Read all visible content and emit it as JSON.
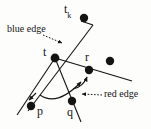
{
  "figure": {
    "name": "edge-flip-geometry-diagram",
    "background_color": "#fdfdfb",
    "ink_color": "#141414",
    "labels": {
      "tk_base": "t",
      "tk_sub": "k",
      "t": "t",
      "r": "r",
      "p": "p",
      "q": "q",
      "blue_edge": "blue edge",
      "red_edge": "red edge"
    },
    "points": [
      {
        "id": "t",
        "label": "t",
        "x": 55,
        "y": 58,
        "radius": 4.2
      },
      {
        "id": "tk",
        "label": "t",
        "x": 84,
        "y": 18,
        "radius": 4.2
      },
      {
        "id": "r",
        "label": "r",
        "x": 89,
        "y": 70,
        "radius": 4.2
      },
      {
        "id": "p",
        "label": "p",
        "x": 31,
        "y": 106,
        "radius": 4.2
      },
      {
        "id": "q",
        "label": "q",
        "x": 72,
        "y": 101,
        "radius": 4.2
      },
      {
        "id": "s",
        "label": "",
        "x": 110,
        "y": 61,
        "radius": 4.2
      }
    ],
    "segments": [
      {
        "id": "blue-edge-line",
        "x1": 93,
        "y1": 25,
        "x2": 28,
        "y2": 111
      },
      {
        "id": "t-to-r-line",
        "x1": 55,
        "y1": 58,
        "x2": 130,
        "y2": 80
      },
      {
        "id": "t-to-p-line",
        "x1": 55,
        "y1": 58,
        "x2": 18,
        "y2": 114
      },
      {
        "id": "t-to-q-line",
        "x1": 55,
        "y1": 58,
        "x2": 80,
        "y2": 120
      }
    ],
    "arcs": [
      {
        "id": "rotation-arc-p-to-q",
        "d": "M 41 96 Q 58 106 82 81"
      },
      {
        "id": "rotation-arc-q-to-r",
        "d": "M 74 88 Q 84 86 88 76"
      }
    ],
    "pointers": [
      {
        "id": "blue-edge-pointer",
        "x1": 44,
        "y1": 35,
        "x2": 63,
        "y2": 43
      },
      {
        "id": "red-edge-pointer",
        "x1": 101,
        "y1": 95,
        "x2": 81,
        "y2": 94
      }
    ]
  }
}
